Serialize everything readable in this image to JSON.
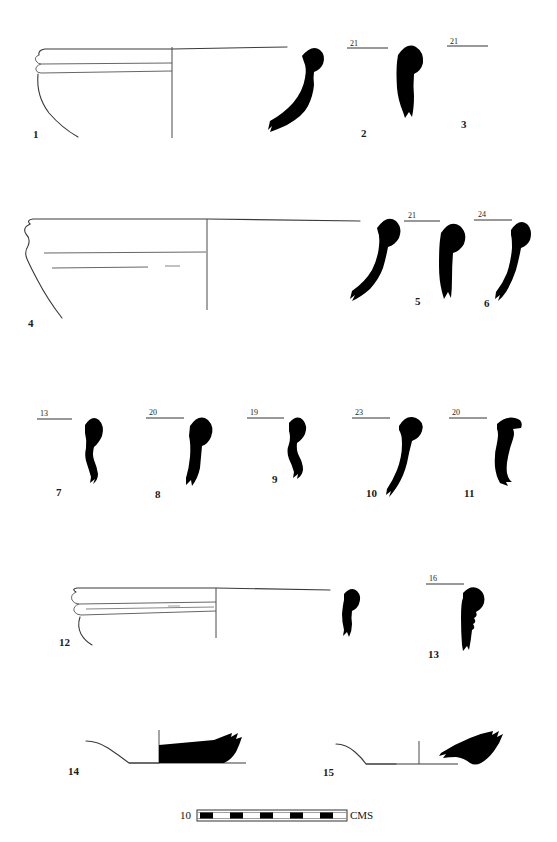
{
  "plate": {
    "width": 557,
    "height": 842,
    "background_color": "#ffffff",
    "ink_color": "#000000",
    "outline_color": "#3a3a3a",
    "type": "archaeological-pottery-profile-plate"
  },
  "scale_bar": {
    "left_label": "10",
    "right_label": "CMS",
    "segments": 10,
    "filled_segments": 5,
    "x": 197,
    "y": 810,
    "width": 150,
    "height": 11
  },
  "figures": [
    {
      "id": "1",
      "number": "1",
      "kind": "rim-profile-half-section",
      "dimension": "",
      "num_x": 33,
      "num_y": 129,
      "has_dimension_line": false
    },
    {
      "id": "2",
      "number": "2",
      "kind": "rim-sherd-silhouette",
      "dimension": "21",
      "num_x": 361,
      "num_y": 128,
      "dim_x": 350,
      "dim_y": 40,
      "dim_line_x1": 347,
      "dim_line_x2": 388,
      "dim_line_y": 48,
      "has_dimension_line": true
    },
    {
      "id": "3",
      "number": "3",
      "kind": "rim-sherd-silhouette",
      "dimension": "21",
      "num_x": 461,
      "num_y": 119,
      "dim_x": 450,
      "dim_y": 38,
      "dim_line_x1": 447,
      "dim_line_x2": 488,
      "dim_line_y": 46,
      "has_dimension_line": true
    },
    {
      "id": "4",
      "number": "4",
      "kind": "rim-profile-half-section",
      "dimension": "",
      "num_x": 28,
      "num_y": 318,
      "has_dimension_line": false
    },
    {
      "id": "5",
      "number": "5",
      "kind": "rim-sherd-silhouette",
      "dimension": "21",
      "num_x": 415,
      "num_y": 296,
      "dim_x": 408,
      "dim_y": 212,
      "dim_line_x1": 404,
      "dim_line_x2": 440,
      "dim_line_y": 221,
      "has_dimension_line": true
    },
    {
      "id": "6",
      "number": "6",
      "kind": "rim-sherd-silhouette",
      "dimension": "24",
      "num_x": 484,
      "num_y": 298,
      "dim_x": 478,
      "dim_y": 211,
      "dim_line_x1": 474,
      "dim_line_x2": 512,
      "dim_line_y": 220,
      "has_dimension_line": true
    },
    {
      "id": "7",
      "number": "7",
      "kind": "rim-sherd-silhouette",
      "dimension": "13",
      "num_x": 56,
      "num_y": 487,
      "dim_x": 40,
      "dim_y": 410,
      "dim_line_x1": 37,
      "dim_line_x2": 72,
      "dim_line_y": 419,
      "has_dimension_line": true
    },
    {
      "id": "8",
      "number": "8",
      "kind": "rim-sherd-silhouette",
      "dimension": "20",
      "num_x": 155,
      "num_y": 489,
      "dim_x": 149,
      "dim_y": 409,
      "dim_line_x1": 146,
      "dim_line_x2": 184,
      "dim_line_y": 418,
      "has_dimension_line": true
    },
    {
      "id": "9",
      "number": "9",
      "kind": "rim-sherd-silhouette",
      "dimension": "19",
      "num_x": 272,
      "num_y": 474,
      "dim_x": 250,
      "dim_y": 409,
      "dim_line_x1": 247,
      "dim_line_x2": 284,
      "dim_line_y": 418,
      "has_dimension_line": true
    },
    {
      "id": "10",
      "number": "10",
      "kind": "rim-sherd-silhouette",
      "dimension": "23",
      "num_x": 366,
      "num_y": 488,
      "dim_x": 355,
      "dim_y": 409,
      "dim_line_x1": 352,
      "dim_line_x2": 390,
      "dim_line_y": 418,
      "has_dimension_line": true
    },
    {
      "id": "11",
      "number": "11",
      "kind": "rim-sherd-silhouette",
      "dimension": "20",
      "num_x": 464,
      "num_y": 488,
      "dim_x": 452,
      "dim_y": 409,
      "dim_line_x1": 449,
      "dim_line_x2": 487,
      "dim_line_y": 418,
      "has_dimension_line": true
    },
    {
      "id": "12",
      "number": "12",
      "kind": "rim-profile-half-section",
      "dimension": "",
      "num_x": 59,
      "num_y": 637,
      "has_dimension_line": false
    },
    {
      "id": "13",
      "number": "13",
      "kind": "rim-sherd-silhouette",
      "dimension": "16",
      "num_x": 428,
      "num_y": 649,
      "dim_x": 429,
      "dim_y": 575,
      "dim_line_x1": 426,
      "dim_line_x2": 464,
      "dim_line_y": 584,
      "has_dimension_line": true
    },
    {
      "id": "14",
      "number": "14",
      "kind": "base-profile-half-section",
      "dimension": "",
      "num_x": 68,
      "num_y": 766,
      "has_dimension_line": false
    },
    {
      "id": "15",
      "number": "15",
      "kind": "base-profile-half-section",
      "dimension": "",
      "num_x": 323,
      "num_y": 767,
      "has_dimension_line": false
    }
  ]
}
